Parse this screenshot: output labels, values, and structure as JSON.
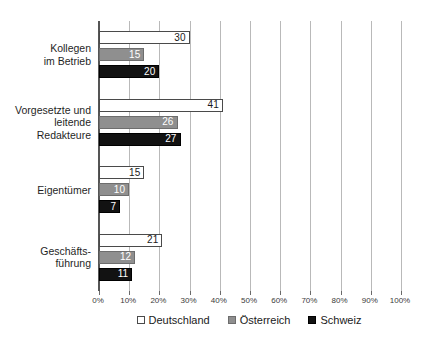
{
  "chart_data": {
    "type": "bar",
    "orientation": "horizontal",
    "title": "",
    "xlabel": "",
    "ylabel": "",
    "xlim": [
      0,
      100
    ],
    "xticks": [
      "0%",
      "10%",
      "20%",
      "30%",
      "40%",
      "50%",
      "60%",
      "70%",
      "80%",
      "90%",
      "100%"
    ],
    "grid": true,
    "legend_position": "bottom",
    "categories": [
      "Kollegen\nim Betrieb",
      "Vorgesetzte und\nleitende\nRedakteure",
      "Eigentümer",
      "Geschäfts-\nführung"
    ],
    "series": [
      {
        "name": "Deutschland",
        "color": "#ffffff",
        "border_color": "#4a4a4a",
        "values": [
          30,
          41,
          15,
          21
        ]
      },
      {
        "name": "Österreich",
        "color": "#8f8f8f",
        "border_color": "#6d6d6d",
        "values": [
          15,
          26,
          10,
          12
        ]
      },
      {
        "name": "Schweiz",
        "color": "#121212",
        "border_color": "#000000",
        "values": [
          20,
          27,
          7,
          11
        ]
      }
    ],
    "data_labels": [
      [
        "30",
        "15",
        "20"
      ],
      [
        "41",
        "26",
        "27"
      ],
      [
        "15",
        "10",
        "7"
      ],
      [
        "21",
        "12",
        "11"
      ]
    ]
  },
  "legend": {
    "items": [
      {
        "label": "Deutschland",
        "swatch": "series-de"
      },
      {
        "label": "Österreich",
        "swatch": "series-at"
      },
      {
        "label": "Schweiz",
        "swatch": "series-ch"
      }
    ]
  }
}
